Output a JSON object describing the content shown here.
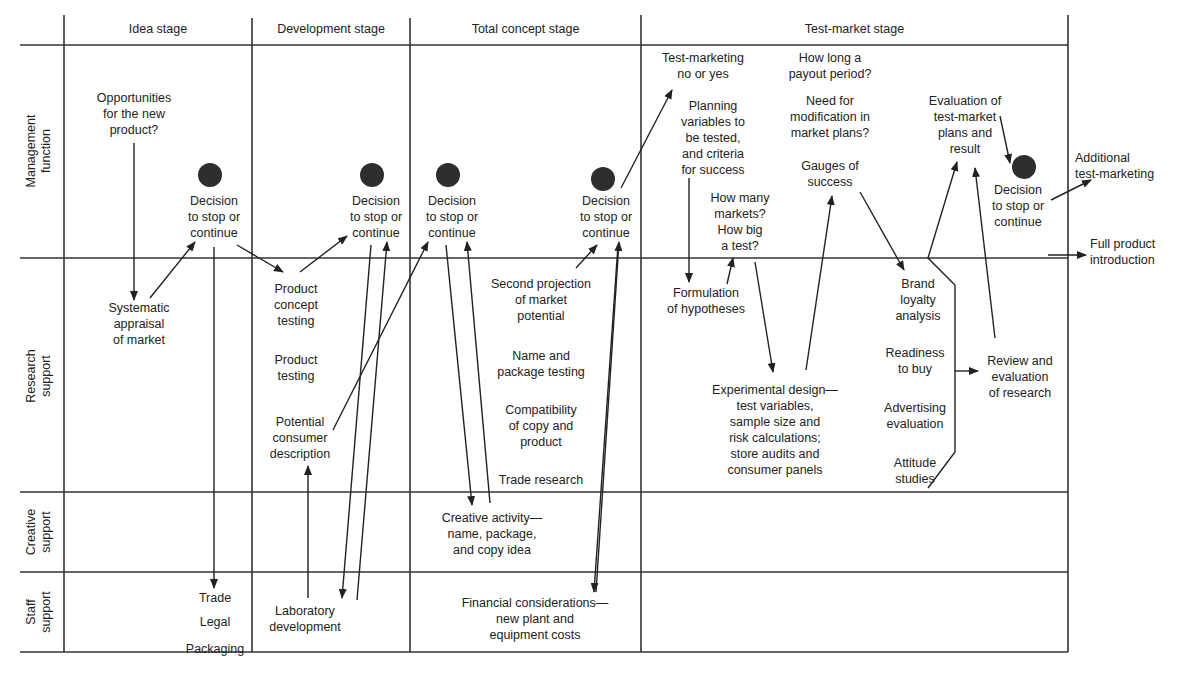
{
  "figure": {
    "columns": [
      "Idea stage",
      "Development stage",
      "Total concept stage",
      "Test-market stage"
    ],
    "rows": [
      "Management\nfunction",
      "Research\nsupport",
      "Creative\nsupport",
      "Staff\nsupport"
    ],
    "decision_label": "Decision\nto stop or\ncontinue",
    "idea": {
      "opportunities": "Opportunities\nfor the new\nproduct?",
      "appraisal": "Systematic\nappraisal\nof market",
      "staff": [
        "Trade",
        "Legal",
        "Packaging"
      ]
    },
    "development": {
      "concept_testing": "Product\nconcept\ntesting",
      "product_testing": "Product\ntesting",
      "consumer_description": "Potential\nconsumer\ndescription",
      "lab": "Laboratory\ndevelopment"
    },
    "total_concept": {
      "second_projection": "Second projection\nof market\npotential",
      "name_package": "Name and\npackage testing",
      "compatibility": "Compatibility\nof copy and\nproduct",
      "trade_research": "Trade research",
      "creative": "Creative activity—\nname, package,\nand copy idea",
      "financial": "Financial considerations—\nnew plant and\nequipment costs"
    },
    "test_market": {
      "test_marketing": "Test-marketing\nno or yes",
      "planning": "Planning\nvariables to\nbe tested,\nand criteria\nfor success",
      "how_many": "How many\nmarkets?\nHow big\na test?",
      "payout": "How long a\npayout period?",
      "modification": "Need for\nmodification in\nmarket plans?",
      "gauges": "Gauges of\nsuccess",
      "evaluation": "Evaluation of\ntest-market\nplans and\nresult",
      "hypotheses": "Formulation\nof hypotheses",
      "experimental": "Experimental design—\ntest variables,\nsample size and\nrisk calculations;\nstore audits  and\nconsumer panels",
      "brand_loyalty": "Brand\nloyalty\nanalysis",
      "readiness": "Readiness\nto buy",
      "advertising": "Advertising\nevaluation",
      "attitude": "Attitude\nstudies",
      "review": "Review and\nevaluation\nof research"
    },
    "outcomes": {
      "additional": "Additional\ntest-marketing",
      "full_intro": "Full product\nintroduction"
    },
    "colors": {
      "ink": "#222222",
      "dot": "#2e2e2e",
      "background": "#ffffff"
    }
  }
}
